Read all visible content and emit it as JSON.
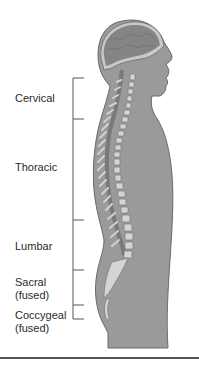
{
  "diagram": {
    "colors": {
      "body": "#9a9a9a",
      "body_outline": "#6a6a6a",
      "brain": "#8c8c8c",
      "bone": "#d4d4d4",
      "bracket": "#555555",
      "text": "#2a2a2a"
    },
    "regions": [
      {
        "id": "cervical",
        "label": "Cervical",
        "sub": ""
      },
      {
        "id": "thoracic",
        "label": "Thoracic",
        "sub": ""
      },
      {
        "id": "lumbar",
        "label": "Lumbar",
        "sub": ""
      },
      {
        "id": "sacral",
        "label": "Sacral",
        "sub": "(fused)"
      },
      {
        "id": "coccygeal",
        "label": "Coccygeal",
        "sub": "(fused)"
      }
    ]
  }
}
